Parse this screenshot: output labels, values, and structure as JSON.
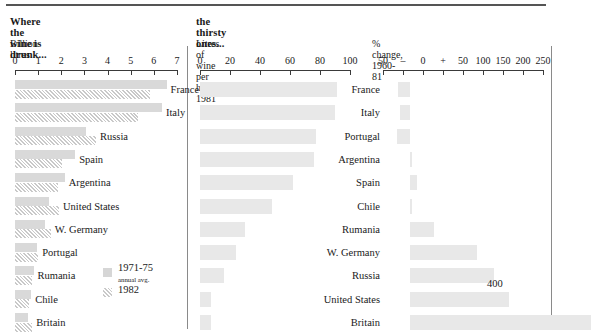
{
  "figure": {
    "panels": [
      {
        "title": "Where the wine is drunk...",
        "subtitle": "Billion litres",
        "axis": {
          "ticks": [
            "0",
            "1",
            "2",
            "3",
            "4",
            "5",
            "6",
            "7"
          ]
        }
      },
      {
        "title": "the thirsty ones...",
        "subtitle": "Litres of wine per head: 1981",
        "axis": {
          "ticks": [
            "0",
            "20",
            "40",
            "60",
            "80",
            "100"
          ]
        }
      },
      {
        "title": "",
        "subtitle": "% change, 1960-81",
        "axis": {
          "ticks": [
            "50",
            "–",
            "0",
            "+",
            "50",
            "100",
            "150",
            "200",
            "250"
          ]
        }
      }
    ],
    "legend": {
      "series1_label": "1971-75",
      "series1_sub": "annual avg.",
      "series2_label": "1982"
    },
    "annotations": [
      {
        "text": "400"
      }
    ]
  },
  "chart_data": [
    {
      "type": "bar",
      "title": "Where the wine is drunk...",
      "xlabel": "Billion litres",
      "ylabel": "",
      "xlim": [
        0,
        7
      ],
      "grid": false,
      "orientation": "horizontal",
      "legend": [
        "1971-75 annual avg.",
        "1982"
      ],
      "categories": [
        "France",
        "Italy",
        "Russia",
        "Spain",
        "Argentina",
        "United States",
        "W. Germany",
        "Portugal",
        "Rumania",
        "Chile",
        "Britain"
      ],
      "series": [
        {
          "name": "1971-75 annual avg.",
          "values": [
            6.55,
            6.35,
            3.05,
            2.6,
            2.15,
            1.45,
            1.3,
            0.95,
            0.8,
            0.7,
            0.55
          ]
        },
        {
          "name": "1982",
          "values": [
            5.85,
            5.3,
            3.5,
            2.05,
            1.85,
            1.9,
            1.55,
            1.0,
            0.75,
            0.6,
            0.75
          ]
        }
      ]
    },
    {
      "type": "bar",
      "title": "the thirsty ones...",
      "xlabel": "Litres of wine per head: 1981",
      "ylabel": "",
      "xlim": [
        0,
        100
      ],
      "grid": false,
      "orientation": "horizontal",
      "categories": [
        "France",
        "Italy",
        "Portugal",
        "Argentina",
        "Spain",
        "Chile",
        "Rumania",
        "W. Germany",
        "Russia",
        "United States",
        "Britain"
      ],
      "values": [
        91,
        90,
        77,
        76,
        62,
        48,
        30,
        24,
        16,
        7,
        7
      ]
    },
    {
      "type": "bar",
      "title": "% change, 1960-81",
      "xlabel": "% change, 1960-81",
      "ylabel": "",
      "xlim": [
        -50,
        250
      ],
      "grid": false,
      "orientation": "horizontal",
      "categories": [
        "France",
        "Italy",
        "Portugal",
        "Argentina",
        "Spain",
        "Chile",
        "Rumania",
        "W. Germany",
        "Russia",
        "United States",
        "Britain"
      ],
      "values": [
        -22,
        -18,
        -24,
        5,
        14,
        4,
        45,
        126,
        158,
        187,
        400
      ],
      "annotations": [
        {
          "category": "United States",
          "text": "400"
        }
      ]
    }
  ]
}
